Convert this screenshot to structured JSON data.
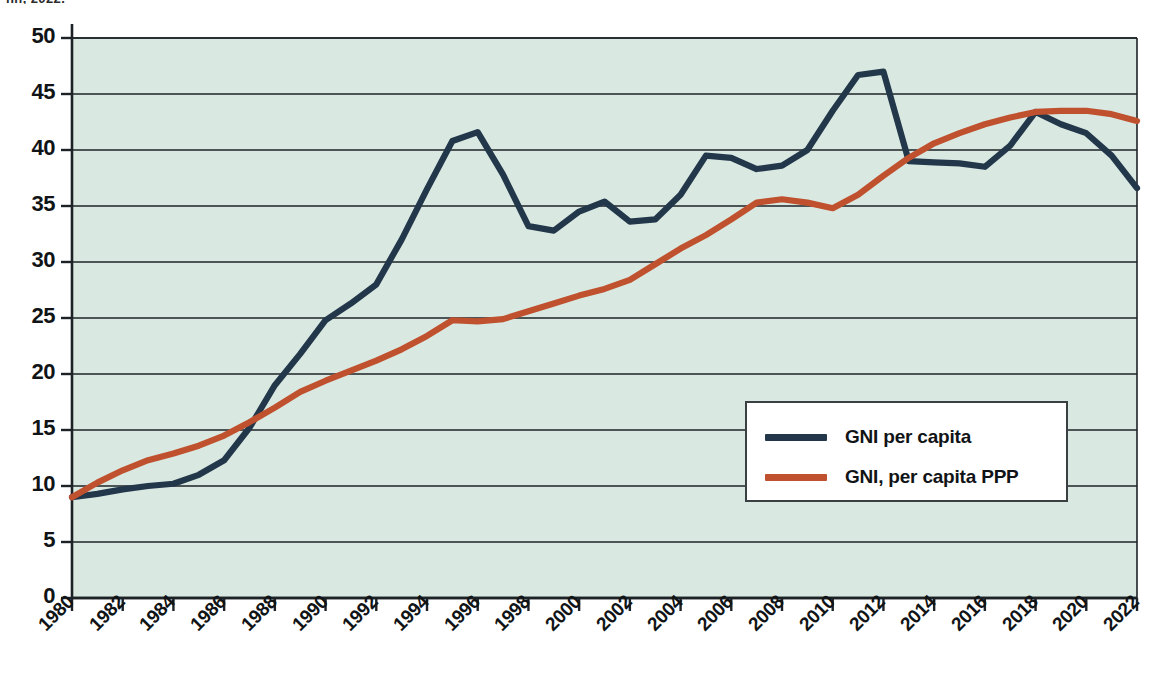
{
  "caption": {
    "clipped_text": "nn, 2022."
  },
  "colors": {
    "plot_background": "#d9e9e1",
    "page_background": "#ffffff",
    "axis": "#1d2226",
    "gridline": "#1d2226",
    "series_gni_per_capita": "#23374b",
    "series_gni_per_capita_ppp": "#c0512f",
    "text": "#111416",
    "legend_border": "#3a3f42",
    "legend_background": "#ffffff"
  },
  "legend": {
    "position": "inside-bottom-right",
    "entries": [
      {
        "label": "GNI per capita",
        "color": "#23374b"
      },
      {
        "label": "GNI, per capita PPP",
        "color": "#c0512f"
      }
    ]
  },
  "axes": {
    "y_ticks": [
      "0",
      "5",
      "10",
      "15",
      "20",
      "25",
      "30",
      "35",
      "40",
      "45",
      "50"
    ],
    "x_ticks": [
      "1980",
      "1982",
      "1984",
      "1986",
      "1988",
      "1990",
      "1992",
      "1994",
      "1996",
      "1998",
      "2000",
      "2002",
      "2004",
      "2006",
      "2008",
      "2010",
      "2012",
      "2014",
      "2016",
      "2018",
      "2020",
      "2022"
    ],
    "x_tick_rotation_deg": -45,
    "ylabel": "",
    "xlabel": ""
  },
  "chart_data": {
    "type": "line",
    "title": "",
    "subtitle": "",
    "xlabel": "",
    "ylabel": "",
    "xlim": [
      1980,
      2022
    ],
    "ylim": [
      0,
      50
    ],
    "ytick_step": 5,
    "xtick_step": 2,
    "grid": "horizontal",
    "legend_position": "inside-bottom-right",
    "x": [
      1980,
      1981,
      1982,
      1983,
      1984,
      1985,
      1986,
      1987,
      1988,
      1989,
      1990,
      1991,
      1992,
      1993,
      1994,
      1995,
      1996,
      1997,
      1998,
      1999,
      2000,
      2001,
      2002,
      2003,
      2004,
      2005,
      2006,
      2007,
      2008,
      2009,
      2010,
      2011,
      2012,
      2013,
      2014,
      2015,
      2016,
      2017,
      2018,
      2019,
      2020,
      2021,
      2022
    ],
    "series": [
      {
        "name": "GNI per capita",
        "color": "#23374b",
        "values": [
          9.0,
          9.3,
          9.7,
          10.0,
          10.2,
          11.0,
          12.3,
          15.2,
          19.0,
          21.8,
          24.8,
          26.3,
          28.0,
          32.0,
          36.5,
          40.8,
          41.6,
          37.8,
          33.2,
          32.8,
          34.5,
          35.4,
          33.6,
          33.8,
          36.0,
          39.5,
          39.3,
          38.3,
          38.6,
          40.0,
          43.5,
          46.7,
          47.0,
          39.0,
          38.9,
          38.8,
          38.5,
          40.4,
          43.4,
          42.3,
          41.5,
          39.5,
          36.6
        ]
      },
      {
        "name": "GNI, per capita PPP",
        "color": "#c0512f",
        "values": [
          9.0,
          10.3,
          11.4,
          12.3,
          12.9,
          13.6,
          14.5,
          15.7,
          17.0,
          18.4,
          19.4,
          20.3,
          21.2,
          22.2,
          23.4,
          24.8,
          24.7,
          24.9,
          25.6,
          26.3,
          27.0,
          27.6,
          28.4,
          29.8,
          31.2,
          32.4,
          33.8,
          35.3,
          35.6,
          35.3,
          34.8,
          36.0,
          37.7,
          39.3,
          40.6,
          41.5,
          42.3,
          42.9,
          43.4,
          43.5,
          43.5,
          43.2,
          42.6
        ]
      }
    ]
  }
}
